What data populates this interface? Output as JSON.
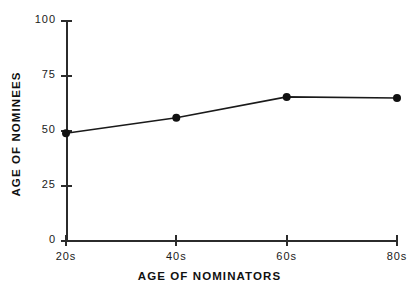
{
  "figure": {
    "scan_artifact_text": "· · ·   ·   ·    ·     ·",
    "background_color": "#ffffff",
    "ink_color": "#1a1a1a"
  },
  "chart_data": {
    "type": "line",
    "title": "",
    "subtitle": "",
    "xlabel": "AGE OF NOMINATORS",
    "ylabel": "AGE OF NOMINEES",
    "categories": [
      "20s",
      "40s",
      "60s",
      "80s"
    ],
    "values": [
      49,
      56,
      65.5,
      65
    ],
    "series": [
      {
        "name": "Age of nominees",
        "values": [
          49,
          56,
          65.5,
          65
        ]
      }
    ],
    "ylim": [
      0,
      100
    ],
    "yticks": [
      0,
      25,
      50,
      75,
      100
    ],
    "ytick_labels": [
      "0",
      "25",
      "50",
      "75",
      "100"
    ],
    "xtick_labels": [
      "20s",
      "40s",
      "60s",
      "80s"
    ],
    "grid": false,
    "legend": false,
    "legend_position": "none",
    "marker": "filled-circle",
    "line_color": "#1a1a1a",
    "marker_color": "#111111",
    "annotations": []
  }
}
